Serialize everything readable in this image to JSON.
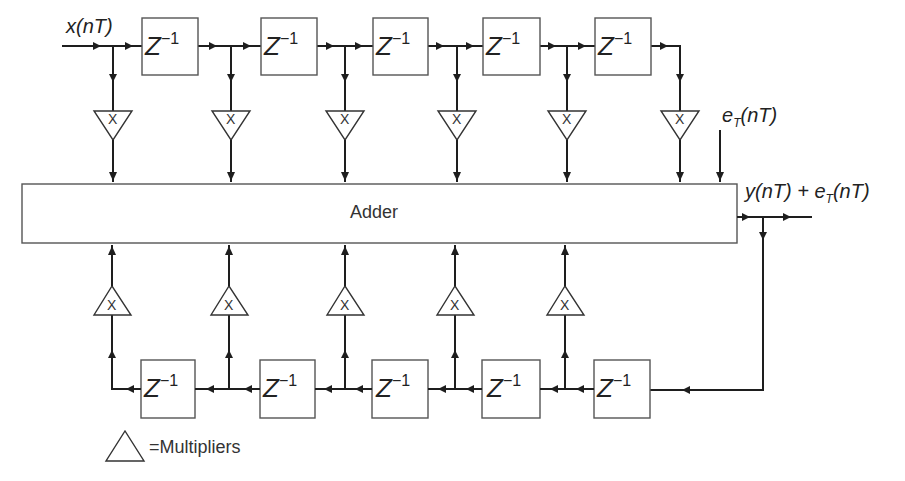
{
  "diagram": {
    "input_label": "x(nT)",
    "error_label": "e_T(nT)",
    "error_label_main": "e",
    "error_label_sub": "T",
    "error_label_rest": "(nT)",
    "output_label_y": "y(nT) + ",
    "output_label_e": "e",
    "output_label_sub": "T",
    "output_label_rest": "(nT)",
    "adder_label": "Adder",
    "delay_label": "Z",
    "delay_exponent": "−1",
    "multiplier_symbol": "X",
    "legend_text": "=Multipliers",
    "feedforward_taps": 6,
    "feedforward_delays": 5,
    "feedback_taps": 5,
    "feedback_delays": 5,
    "colors": {
      "line": "#1e1e1e",
      "background": "#ffffff"
    }
  }
}
